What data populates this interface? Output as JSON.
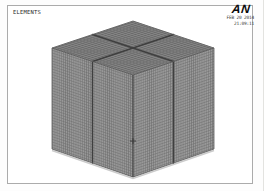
{
  "plot": {
    "label": "ELEMENTS"
  },
  "logo": {
    "text": "AN"
  },
  "status": {
    "date": "FEB 20 2014",
    "time": "21:09:11"
  },
  "colors": {
    "plot_border": "#ababab",
    "text": "#1c1c1c",
    "logo": "#0b0b0b",
    "face_top": "#848484",
    "face_left": "#989898",
    "face_right": "#9a9a9a",
    "mesh_line_top": "#5e5e5e",
    "mesh_line_side": "#696969",
    "divider": "#3f3f3f",
    "edge": "#5a5a5a",
    "front_edge": "#474747",
    "ground_shadow": "#cbcbcb",
    "marker": "#3a3a3a"
  }
}
